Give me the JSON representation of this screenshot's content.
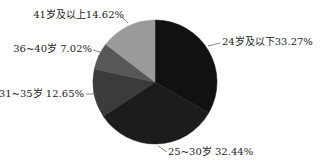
{
  "chart_data": {
    "type": "pie",
    "title": "",
    "start_angle": "12 o'clock",
    "direction": "clockwise",
    "legend": "none",
    "slices": [
      {
        "label": "24岁及以下",
        "value": 33.27,
        "text": "24岁及以下33.27%",
        "color": "#111111"
      },
      {
        "label": "25~30岁",
        "value": 32.44,
        "text": "25~30岁  32.44%",
        "color": "#1c1c1c"
      },
      {
        "label": "31~35岁",
        "value": 12.65,
        "text": "31~35岁 12.65%",
        "color": "#3b3b3b"
      },
      {
        "label": "36~40岁",
        "value": 7.02,
        "text": "36~40岁 7.02%",
        "color": "#575757"
      },
      {
        "label": "41岁及以上",
        "value": 14.62,
        "text": "41岁及以上14.62%",
        "color": "#9a9a9a"
      }
    ],
    "unit": "%"
  }
}
